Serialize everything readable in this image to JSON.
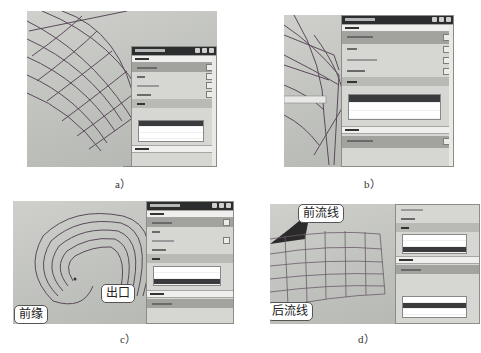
{
  "figure": {
    "subfigures": [
      {
        "id": "a",
        "label": "a）"
      },
      {
        "id": "b",
        "label": "b）"
      },
      {
        "id": "c",
        "label": "c）",
        "callouts": [
          "前缘",
          "出口"
        ]
      },
      {
        "id": "d",
        "label": "d）",
        "callouts": [
          "前流线",
          "后流线"
        ]
      }
    ]
  },
  "colors": {
    "viewport_bg": "#c3c4c0",
    "dialog_bg": "#d6d7d3",
    "dialog_title_bar": "#2c2d2f",
    "mesh_line": "#5a4a5a",
    "list_selected": "#3a3b3d"
  }
}
